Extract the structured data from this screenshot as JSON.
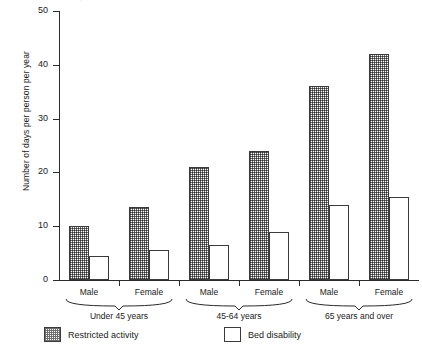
{
  "title_sliver": "Source, national Center for Health Statistics",
  "axes": {
    "ylabel": "Number of days per person per year",
    "yticks": [
      0,
      10,
      20,
      30,
      40,
      50
    ],
    "ymin": 0,
    "ymax": 50
  },
  "legend": {
    "items": [
      {
        "label": "Restricted activity",
        "pattern": "hatched"
      },
      {
        "label": "Bed disability",
        "pattern": "plain"
      }
    ]
  },
  "groups": [
    {
      "label": "Under 45 years",
      "subs": [
        "Male",
        "Female"
      ]
    },
    {
      "label": "45-64 years",
      "subs": [
        "Male",
        "Female"
      ]
    },
    {
      "label": "65 years and over",
      "subs": [
        "Male",
        "Female"
      ]
    }
  ],
  "chart_data": {
    "type": "bar",
    "title": "",
    "xlabel": "",
    "ylabel": "Number of days per person per year",
    "ylim": [
      0,
      50
    ],
    "yticks": [
      0,
      10,
      20,
      30,
      40,
      50
    ],
    "grid": false,
    "legend_position": "bottom",
    "categories": [
      "Under 45 years - Male",
      "Under 45 years - Female",
      "45-64 years - Male",
      "45-64 years - Female",
      "65 years and over - Male",
      "65 years and over - Female"
    ],
    "group_labels": [
      "Under 45 years",
      "45-64 years",
      "65 years and over"
    ],
    "sub_labels": [
      "Male",
      "Female"
    ],
    "series": [
      {
        "name": "Restricted activity",
        "values": [
          10,
          13.5,
          21,
          24,
          36,
          42
        ]
      },
      {
        "name": "Bed disability",
        "values": [
          4.5,
          5.5,
          6.5,
          9,
          14,
          15.5
        ]
      }
    ]
  }
}
